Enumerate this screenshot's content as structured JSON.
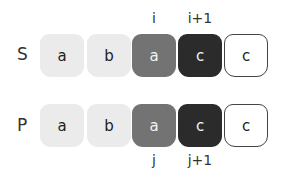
{
  "rows": {
    "s": {
      "label": "S",
      "cells": [
        "a",
        "b",
        "a",
        "c",
        "c"
      ],
      "pointers": [
        "i",
        "i+1"
      ]
    },
    "p": {
      "label": "P",
      "cells": [
        "a",
        "b",
        "a",
        "c",
        "c"
      ],
      "pointers": [
        "j",
        "j+1"
      ]
    }
  },
  "colors": {
    "light": "#ebebeb",
    "mid": "#737373",
    "dark": "#2b2b2b",
    "empty": "#ffffff"
  }
}
